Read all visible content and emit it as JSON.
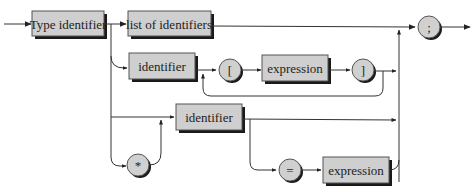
{
  "diagram": {
    "type": "syntax-diagram",
    "nodes": {
      "type_identifier": "Type identifier",
      "list_of_identifiers": "list of identifiers",
      "identifier_array": "identifier",
      "open_bracket": "[",
      "expression_array": "expression",
      "close_bracket": "]",
      "identifier_init": "identifier",
      "pointer_star": "*",
      "equals": "=",
      "expression_init": "expression",
      "semicolon": ";"
    },
    "colors": {
      "box_fill": "#cfcfcf",
      "shadow": "#1a1a1a",
      "line": "#333333"
    }
  }
}
